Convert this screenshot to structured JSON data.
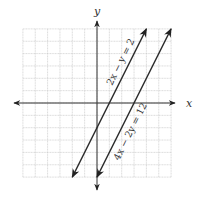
{
  "chart_data": {
    "type": "line",
    "title": "",
    "xlabel": "x",
    "ylabel": "y",
    "xlim": [
      -6,
      6
    ],
    "ylim": [
      -6,
      6
    ],
    "grid": true,
    "grid_step": 1,
    "series": [
      {
        "name": "2x − y = 2",
        "equation": "y = 2x - 2",
        "x": [
          -2,
          4
        ],
        "y": [
          -6,
          6
        ],
        "arrows": "both"
      },
      {
        "name": "4x − 2y = 12",
        "equation": "y = 2x - 6",
        "x": [
          0,
          6
        ],
        "y": [
          -6,
          6
        ],
        "arrows": "both"
      }
    ],
    "annotations": [
      {
        "text": "2x − y = 2",
        "rotated": true,
        "near_series": 0
      },
      {
        "text": "4x − 2y = 12",
        "rotated": true,
        "near_series": 1
      }
    ]
  },
  "labels": {
    "x_axis": "x",
    "y_axis": "y",
    "line1": "2x − y = 2",
    "line2": "4x − 2y = 12"
  }
}
